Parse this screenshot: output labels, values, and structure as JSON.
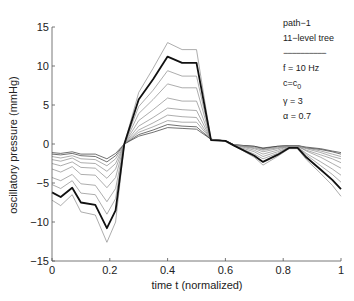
{
  "chart_data": {
    "type": "line",
    "title": "",
    "xlabel": "time t (normalized)",
    "ylabel": "oscillatory pressure (mmHg)",
    "xlim": [
      0,
      1
    ],
    "ylim": [
      -15,
      15
    ],
    "xticks": [
      0,
      0.2,
      0.4,
      0.6,
      0.8,
      1
    ],
    "xtick_labels": [
      "0",
      "0.2",
      "0.4",
      "0.6",
      "0.8",
      "1"
    ],
    "yticks": [
      15,
      10,
      5,
      0,
      -5,
      -10,
      -15
    ],
    "ytick_labels": [
      "15",
      "10",
      "5",
      "0",
      "−5",
      "−10",
      "−15"
    ],
    "grid": false,
    "legend_position": "upper right (text annotation)",
    "x": [
      0,
      0.03,
      0.07,
      0.1,
      0.15,
      0.19,
      0.22,
      0.25,
      0.3,
      0.35,
      0.4,
      0.45,
      0.5,
      0.55,
      0.6,
      0.63,
      0.7,
      0.73,
      0.78,
      0.82,
      0.85,
      0.88,
      0.93,
      0.97,
      1.0
    ],
    "series": [
      {
        "name": "level-1",
        "style": "dark-thin",
        "values": [
          -1.1,
          -1.2,
          -1.0,
          -1.3,
          -1.3,
          -1.9,
          -1.2,
          0,
          1.0,
          1.5,
          2.1,
          2.0,
          1.9,
          0.6,
          0.4,
          -0.1,
          -0.3,
          -0.5,
          -0.3,
          -0.2,
          -0.2,
          -0.4,
          -0.6,
          -0.9,
          -1.1
        ]
      },
      {
        "name": "level-2",
        "style": "dark-thin",
        "values": [
          -1.3,
          -1.4,
          -1.2,
          -1.5,
          -1.6,
          -2.3,
          -1.5,
          0,
          1.2,
          1.8,
          2.5,
          2.3,
          2.2,
          0.6,
          0.4,
          -0.1,
          -0.3,
          -0.6,
          -0.3,
          -0.2,
          -0.2,
          -0.5,
          -0.7,
          -1.0,
          -1.3
        ]
      },
      {
        "name": "level-3",
        "style": "thin",
        "values": [
          -1.6,
          -1.8,
          -1.5,
          -1.9,
          -2.0,
          -2.8,
          -1.9,
          0,
          1.5,
          2.2,
          3.0,
          2.8,
          2.8,
          0.6,
          0.4,
          -0.1,
          -0.4,
          -0.7,
          -0.4,
          -0.2,
          -0.2,
          -0.5,
          -0.9,
          -1.3,
          -1.6
        ]
      },
      {
        "name": "level-4",
        "style": "thin",
        "values": [
          -2.0,
          -2.2,
          -1.8,
          -2.4,
          -2.5,
          -3.5,
          -2.5,
          0,
          1.8,
          2.7,
          3.7,
          3.5,
          3.4,
          0.6,
          0.4,
          -0.1,
          -0.5,
          -0.8,
          -0.5,
          -0.3,
          -0.3,
          -0.6,
          -1.1,
          -1.6,
          -1.9
        ]
      },
      {
        "name": "level-5",
        "style": "thin",
        "values": [
          -2.5,
          -2.8,
          -2.3,
          -3.0,
          -3.1,
          -4.4,
          -3.2,
          0,
          2.3,
          3.4,
          4.6,
          4.4,
          4.3,
          0.6,
          0.4,
          -0.1,
          -0.6,
          -1.0,
          -0.6,
          -0.3,
          -0.3,
          -0.8,
          -1.4,
          -1.9,
          -2.4
        ]
      },
      {
        "name": "level-6",
        "style": "thin",
        "values": [
          -3.2,
          -3.6,
          -2.9,
          -3.9,
          -4.0,
          -5.6,
          -4.3,
          0,
          3.0,
          4.4,
          5.9,
          5.5,
          5.5,
          0.6,
          0.4,
          -0.1,
          -0.8,
          -1.3,
          -0.8,
          -0.3,
          -0.3,
          -0.9,
          -1.7,
          -2.5,
          -3.1
        ]
      },
      {
        "name": "level-7",
        "style": "thin",
        "values": [
          -4.3,
          -4.7,
          -3.9,
          -5.1,
          -5.3,
          -7.4,
          -5.7,
          0,
          3.9,
          5.7,
          7.7,
          7.2,
          7.2,
          0.5,
          0.4,
          -0.2,
          -1.0,
          -1.6,
          -1.0,
          -0.4,
          -0.4,
          -1.2,
          -2.3,
          -3.2,
          -4.0
        ]
      },
      {
        "name": "level-8",
        "style": "thin",
        "values": [
          -5.2,
          -5.7,
          -4.7,
          -6.3,
          -6.5,
          -9.0,
          -7.0,
          0,
          4.8,
          6.9,
          9.4,
          8.7,
          8.7,
          0.5,
          0.4,
          -0.2,
          -1.3,
          -1.9,
          -1.2,
          -0.4,
          -0.4,
          -1.4,
          -2.8,
          -3.9,
          -4.9
        ]
      },
      {
        "name": "level-9 (highlighted)",
        "style": "thick",
        "values": [
          -6.2,
          -6.8,
          -5.6,
          -7.5,
          -7.8,
          -10.8,
          -8.5,
          0,
          5.7,
          8.3,
          11.2,
          10.4,
          10.4,
          0.5,
          0.4,
          -0.2,
          -1.5,
          -2.3,
          -1.4,
          -0.5,
          -0.5,
          -1.7,
          -3.3,
          -4.6,
          -5.8
        ]
      },
      {
        "name": "level-10",
        "style": "thin",
        "values": [
          -7.2,
          -7.9,
          -6.5,
          -8.7,
          -9.1,
          -12.6,
          -10.0,
          0,
          6.6,
          9.7,
          13.0,
          12.1,
          12.1,
          0.5,
          0.4,
          -0.2,
          -1.7,
          -2.7,
          -1.6,
          -0.6,
          -0.6,
          -2.0,
          -3.8,
          -5.3,
          -6.7
        ]
      }
    ],
    "annotations": [
      "path−1",
      "11−level tree",
      "—————————",
      "f = 10 Hz",
      "c=c0",
      "γ = 3",
      "α = 0.7"
    ]
  },
  "legend": {
    "line1": "path−1",
    "line2": "11−level tree",
    "sep": "−−−−−−−−−−",
    "line3": "f = 10 Hz",
    "line4_main": "c=c",
    "line4_sub": "0",
    "line5": "γ = 3",
    "line6": "α = 0.7"
  },
  "colors": {
    "axis": "#555555",
    "thick": "#111111",
    "thin": "#8a8a8a",
    "dark_thin": "#333333"
  }
}
